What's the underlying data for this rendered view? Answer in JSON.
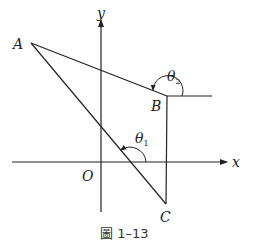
{
  "figure": {
    "caption": "圖 1–13",
    "axes": {
      "x_label": "x",
      "y_label": "y",
      "origin_label": "O"
    },
    "points": {
      "A": "A",
      "B": "B",
      "C": "C"
    },
    "angles": {
      "theta1": {
        "symbol": "θ",
        "subscript": "1"
      },
      "theta2": {
        "symbol": "θ",
        "subscript": "2"
      }
    },
    "colors": {
      "line": "#222222",
      "background": "#ffffff"
    }
  }
}
